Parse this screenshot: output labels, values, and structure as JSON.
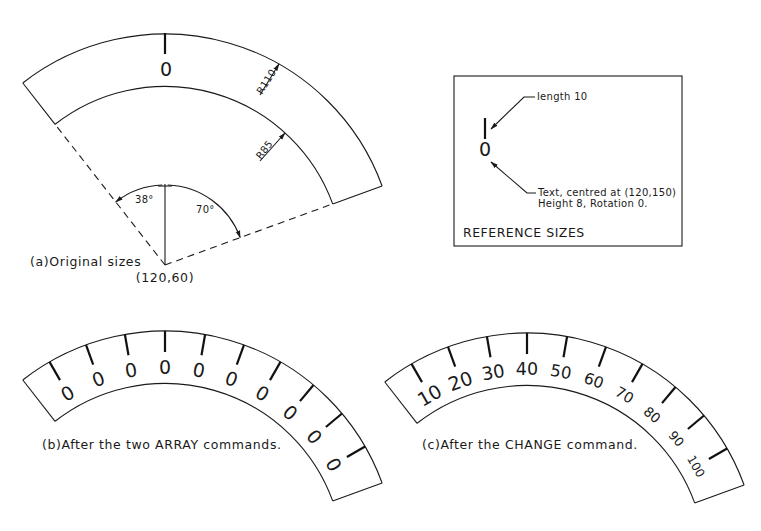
{
  "figure_a": {
    "caption": "(a)Original sizes",
    "center_label": "(120,60)",
    "outer_radius_label": "R110",
    "inner_radius_label": "R85",
    "left_angle_label": "38°",
    "right_angle_label": "70°",
    "text_value": "0"
  },
  "reference_box": {
    "title": "REFERENCE SIZES",
    "tick_note": "length 10",
    "text_note_line1": "Text, centred at (120,150)",
    "text_note_line2": "Height 8, Rotation 0.",
    "text_value": "0"
  },
  "figure_b": {
    "caption": "(b)After the two ARRAY commands.",
    "labels": [
      "0",
      "0",
      "0",
      "0",
      "0",
      "0",
      "0",
      "0",
      "0",
      "0"
    ]
  },
  "figure_c": {
    "caption": "(c)After the CHANGE command.",
    "labels": [
      "10",
      "20",
      "30",
      "40",
      "50",
      "60",
      "70",
      "80",
      "90",
      "100"
    ]
  },
  "geometry": {
    "sector_left_deg": 38,
    "sector_right_deg": 70,
    "outer_r_units": 110,
    "inner_r_units": 85,
    "tick_angles_deg": [
      -30,
      -20,
      -10,
      0,
      10,
      20,
      30,
      40,
      50,
      60
    ]
  },
  "colors": {
    "ink": "#1a1a1a",
    "paper": "#ffffff"
  }
}
